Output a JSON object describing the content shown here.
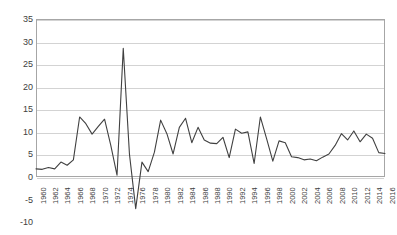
{
  "chart_data": {
    "type": "line",
    "title": "",
    "subtitle": "",
    "xlabel": "",
    "ylabel": "",
    "xlim": [
      1960,
      2016
    ],
    "ylim": [
      -10,
      35
    ],
    "yticks": [
      35,
      30,
      25,
      20,
      15,
      10,
      5,
      0,
      -5,
      -10
    ],
    "ytick_labels": [
      "35",
      "30",
      "25",
      "20",
      "15",
      "10",
      "5",
      "0",
      "-5",
      "-10"
    ],
    "xticks": [
      1960,
      1962,
      1964,
      1966,
      1968,
      1970,
      1972,
      1974,
      1976,
      1978,
      1980,
      1982,
      1984,
      1986,
      1988,
      1990,
      1992,
      1994,
      1996,
      1998,
      2000,
      2002,
      2004,
      2006,
      2008,
      2010,
      2012,
      2014,
      2016
    ],
    "xtick_labels": [
      "1960",
      "1962",
      "1964",
      "1966",
      "1968",
      "1970",
      "1972",
      "1974",
      "1976",
      "1978",
      "1980",
      "1982",
      "1984",
      "1986",
      "1988",
      "1990",
      "1992",
      "1994",
      "1996",
      "1998",
      "2000",
      "2002",
      "2004",
      "2006",
      "2008",
      "2010",
      "2012",
      "2014",
      "2016"
    ],
    "grid": true,
    "legend": false,
    "legend_position": "none",
    "line_color": "#404040",
    "grid_color": "#d3d3d3",
    "axis_color": "#a6a6a6",
    "x": [
      1960,
      1961,
      1962,
      1963,
      1964,
      1965,
      1966,
      1967,
      1968,
      1969,
      1970,
      1971,
      1972,
      1973,
      1974,
      1975,
      1976,
      1977,
      1978,
      1979,
      1980,
      1981,
      1982,
      1983,
      1984,
      1985,
      1986,
      1987,
      1988,
      1989,
      1990,
      1991,
      1992,
      1993,
      1994,
      1995,
      1996,
      1997,
      1998,
      1999,
      2000,
      2001,
      2002,
      2003,
      2004,
      2005,
      2006,
      2007,
      2008,
      2009,
      2010,
      2011,
      2012,
      2013,
      2014,
      2015,
      2016
    ],
    "values": [
      1.8,
      1.7,
      2.1,
      1.8,
      3.3,
      2.6,
      3.8,
      13.3,
      11.8,
      9.5,
      11.2,
      12.8,
      7.0,
      0.4,
      28.5,
      5.0,
      -7.0,
      3.3,
      1.2,
      5.5,
      12.6,
      9.6,
      5.1,
      11.0,
      13.0,
      7.6,
      11.0,
      8.2,
      7.5,
      7.4,
      8.8,
      4.3,
      10.6,
      9.7,
      10.0,
      3.0,
      13.3,
      8.5,
      3.5,
      8.0,
      7.6,
      4.5,
      4.3,
      3.8,
      4.0,
      3.6,
      4.4,
      5.1,
      7.0,
      9.6,
      8.2,
      10.2,
      7.8,
      9.5,
      8.6,
      5.4,
      5.2
    ],
    "series": [
      {
        "name": "value",
        "color": "#404040",
        "values": [
          1.8,
          1.7,
          2.1,
          1.8,
          3.3,
          2.6,
          3.8,
          13.3,
          11.8,
          9.5,
          11.2,
          12.8,
          7.0,
          0.4,
          28.5,
          5.0,
          -7.0,
          3.3,
          1.2,
          5.5,
          12.6,
          9.6,
          5.1,
          11.0,
          13.0,
          7.6,
          11.0,
          8.2,
          7.5,
          7.4,
          8.8,
          4.3,
          10.6,
          9.7,
          10.0,
          3.0,
          13.3,
          8.5,
          3.5,
          8.0,
          7.6,
          4.5,
          4.3,
          3.8,
          4.0,
          3.6,
          4.4,
          5.1,
          7.0,
          9.6,
          8.2,
          10.2,
          7.8,
          9.5,
          8.6,
          5.4,
          5.2
        ]
      }
    ]
  }
}
